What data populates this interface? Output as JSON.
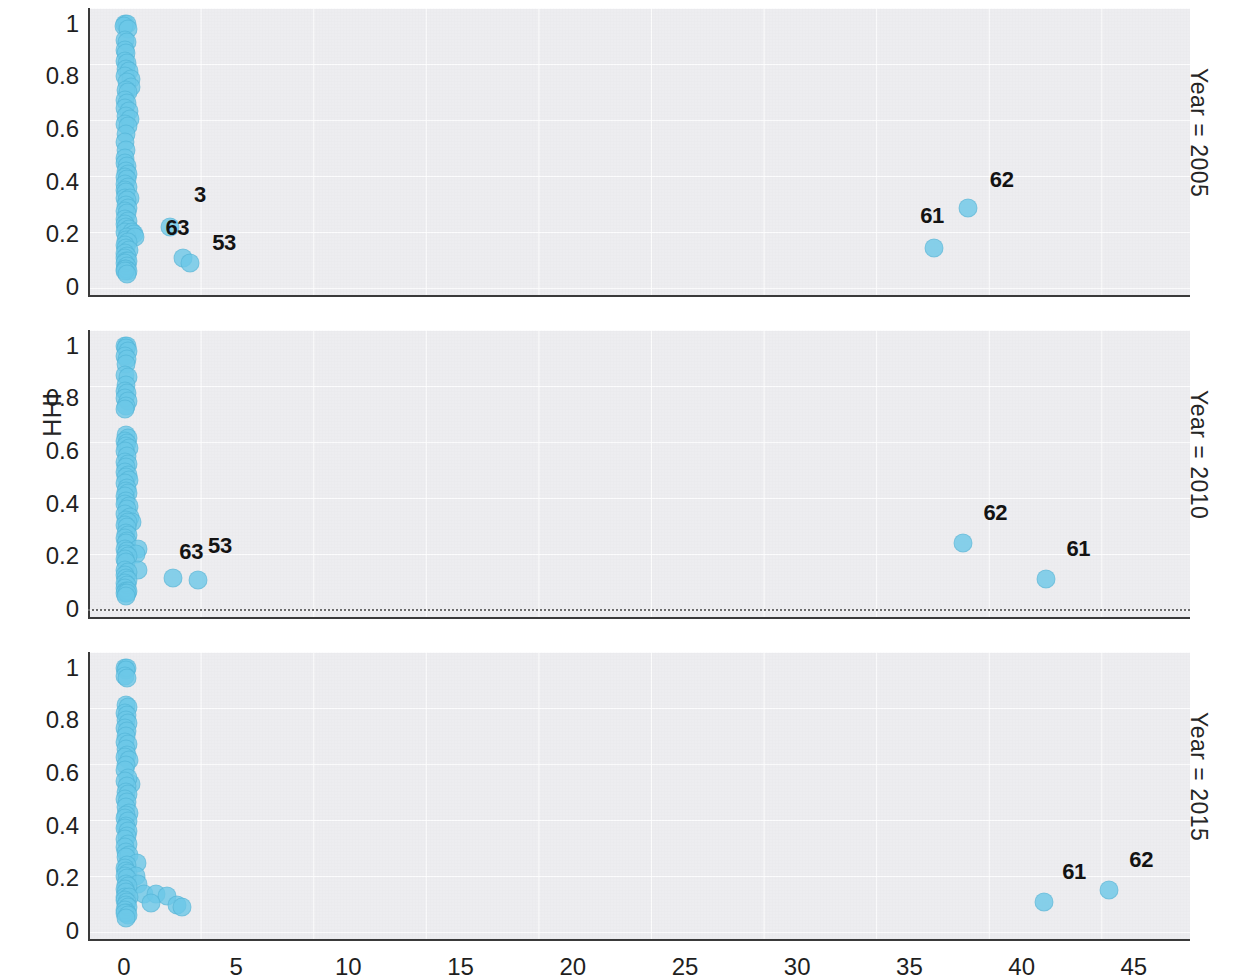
{
  "chart_data": {
    "type": "scatter",
    "title": "",
    "xlabel": "",
    "ylabel": "HHI",
    "xlim": [
      -1.6,
      47.5
    ],
    "ylim": [
      -0.03,
      1.06
    ],
    "xticks": [
      0,
      5,
      10,
      15,
      20,
      25,
      30,
      35,
      40,
      45
    ],
    "yticks": [
      "0",
      "0.2",
      "0.4",
      "0.6",
      "0.8",
      "1"
    ],
    "grid": true,
    "legend": "none",
    "marker_color": "#6CC8E8",
    "facet_variable": "Year",
    "panels": [
      {
        "facet_label": "Year = 2005",
        "zero_line": false,
        "points": [
          {
            "x": 0.05,
            "y": 1.0
          },
          {
            "x": 0.12,
            "y": 1.0
          },
          {
            "x": 0.02,
            "y": 0.99
          },
          {
            "x": 0.16,
            "y": 0.98
          },
          {
            "x": 0.07,
            "y": 0.94
          },
          {
            "x": 0.13,
            "y": 0.93
          },
          {
            "x": 0.04,
            "y": 0.9
          },
          {
            "x": 0.1,
            "y": 0.89
          },
          {
            "x": 0.06,
            "y": 0.86
          },
          {
            "x": 0.15,
            "y": 0.85
          },
          {
            "x": 0.09,
            "y": 0.83
          },
          {
            "x": 0.22,
            "y": 0.82
          },
          {
            "x": 0.05,
            "y": 0.8
          },
          {
            "x": 0.3,
            "y": 0.79
          },
          {
            "x": 0.12,
            "y": 0.78
          },
          {
            "x": 0.33,
            "y": 0.76
          },
          {
            "x": 0.08,
            "y": 0.75
          },
          {
            "x": 0.18,
            "y": 0.74
          },
          {
            "x": 0.06,
            "y": 0.71
          },
          {
            "x": 0.14,
            "y": 0.7
          },
          {
            "x": 0.04,
            "y": 0.68
          },
          {
            "x": 0.21,
            "y": 0.67
          },
          {
            "x": 0.1,
            "y": 0.65
          },
          {
            "x": 0.27,
            "y": 0.64
          },
          {
            "x": 0.06,
            "y": 0.62
          },
          {
            "x": 0.16,
            "y": 0.61
          },
          {
            "x": 0.08,
            "y": 0.58
          },
          {
            "x": 0.05,
            "y": 0.55
          },
          {
            "x": 0.11,
            "y": 0.52
          },
          {
            "x": 0.07,
            "y": 0.49
          },
          {
            "x": 0.03,
            "y": 0.47
          },
          {
            "x": 0.15,
            "y": 0.46
          },
          {
            "x": 0.09,
            "y": 0.44
          },
          {
            "x": 0.2,
            "y": 0.43
          },
          {
            "x": 0.05,
            "y": 0.42
          },
          {
            "x": 0.13,
            "y": 0.41
          },
          {
            "x": 0.07,
            "y": 0.39
          },
          {
            "x": 0.17,
            "y": 0.38
          },
          {
            "x": 0.04,
            "y": 0.37
          },
          {
            "x": 0.11,
            "y": 0.36
          },
          {
            "x": 0.06,
            "y": 0.34
          },
          {
            "x": 0.26,
            "y": 0.34
          },
          {
            "x": 0.14,
            "y": 0.33
          },
          {
            "x": 0.08,
            "y": 0.31
          },
          {
            "x": 0.19,
            "y": 0.3
          },
          {
            "x": 0.05,
            "y": 0.29
          },
          {
            "x": 0.12,
            "y": 0.28
          },
          {
            "x": 0.07,
            "y": 0.26
          },
          {
            "x": 0.16,
            "y": 0.25
          },
          {
            "x": 0.04,
            "y": 0.24
          },
          {
            "x": 0.1,
            "y": 0.23
          },
          {
            "x": 0.23,
            "y": 0.22
          },
          {
            "x": 0.06,
            "y": 0.21
          },
          {
            "x": 0.36,
            "y": 0.21
          },
          {
            "x": 0.44,
            "y": 0.2
          },
          {
            "x": 0.13,
            "y": 0.19
          },
          {
            "x": 0.08,
            "y": 0.18
          },
          {
            "x": 0.5,
            "y": 0.19
          },
          {
            "x": 0.18,
            "y": 0.17
          },
          {
            "x": 0.05,
            "y": 0.16
          },
          {
            "x": 0.11,
            "y": 0.15
          },
          {
            "x": 0.24,
            "y": 0.14
          },
          {
            "x": 0.07,
            "y": 0.13
          },
          {
            "x": 0.15,
            "y": 0.12
          },
          {
            "x": 0.04,
            "y": 0.11
          },
          {
            "x": 0.09,
            "y": 0.1
          },
          {
            "x": 0.2,
            "y": 0.1
          },
          {
            "x": 0.06,
            "y": 0.09
          },
          {
            "x": 0.13,
            "y": 0.08
          },
          {
            "x": 0.03,
            "y": 0.07
          },
          {
            "x": 0.1,
            "y": 0.07
          },
          {
            "x": 0.17,
            "y": 0.06
          },
          {
            "x": 0.05,
            "y": 0.06
          },
          {
            "x": 0.12,
            "y": 0.05
          }
        ],
        "labeled_points": [
          {
            "label": "3",
            "x": 2.05,
            "y": 0.23,
            "label_dx": 30,
            "label_dy": -32
          },
          {
            "label": "63",
            "x": 2.65,
            "y": 0.11,
            "label_dx": -6,
            "label_dy": -30
          },
          {
            "label": "53",
            "x": 2.95,
            "y": 0.09,
            "label_dx": 34,
            "label_dy": -20
          },
          {
            "label": "61",
            "x": 36.1,
            "y": 0.15,
            "label_dx": -2,
            "label_dy": -32
          },
          {
            "label": "62",
            "x": 37.6,
            "y": 0.3,
            "label_dx": 34,
            "label_dy": -28
          }
        ]
      },
      {
        "facet_label": "Year = 2010",
        "zero_line": true,
        "points": [
          {
            "x": 0.05,
            "y": 1.0
          },
          {
            "x": 0.13,
            "y": 1.0
          },
          {
            "x": 0.08,
            "y": 0.99
          },
          {
            "x": 0.18,
            "y": 0.98
          },
          {
            "x": 0.04,
            "y": 0.96
          },
          {
            "x": 0.15,
            "y": 0.95
          },
          {
            "x": 0.09,
            "y": 0.93
          },
          {
            "x": 0.06,
            "y": 0.89
          },
          {
            "x": 0.16,
            "y": 0.88
          },
          {
            "x": 0.1,
            "y": 0.85
          },
          {
            "x": 0.05,
            "y": 0.83
          },
          {
            "x": 0.14,
            "y": 0.82
          },
          {
            "x": 0.07,
            "y": 0.8
          },
          {
            "x": 0.17,
            "y": 0.79
          },
          {
            "x": 0.11,
            "y": 0.77
          },
          {
            "x": 0.06,
            "y": 0.76
          },
          {
            "x": 0.1,
            "y": 0.66
          },
          {
            "x": 0.2,
            "y": 0.65
          },
          {
            "x": 0.05,
            "y": 0.64
          },
          {
            "x": 0.15,
            "y": 0.63
          },
          {
            "x": 0.08,
            "y": 0.62
          },
          {
            "x": 0.23,
            "y": 0.61
          },
          {
            "x": 0.04,
            "y": 0.6
          },
          {
            "x": 0.12,
            "y": 0.58
          },
          {
            "x": 0.07,
            "y": 0.56
          },
          {
            "x": 0.19,
            "y": 0.55
          },
          {
            "x": 0.1,
            "y": 0.54
          },
          {
            "x": 0.05,
            "y": 0.52
          },
          {
            "x": 0.16,
            "y": 0.51
          },
          {
            "x": 0.09,
            "y": 0.5
          },
          {
            "x": 0.22,
            "y": 0.49
          },
          {
            "x": 0.06,
            "y": 0.48
          },
          {
            "x": 0.13,
            "y": 0.46
          },
          {
            "x": 0.08,
            "y": 0.45
          },
          {
            "x": 0.18,
            "y": 0.44
          },
          {
            "x": 0.04,
            "y": 0.43
          },
          {
            "x": 0.11,
            "y": 0.41
          },
          {
            "x": 0.07,
            "y": 0.4
          },
          {
            "x": 0.21,
            "y": 0.39
          },
          {
            "x": 0.14,
            "y": 0.38
          },
          {
            "x": 0.05,
            "y": 0.36
          },
          {
            "x": 0.26,
            "y": 0.35
          },
          {
            "x": 0.09,
            "y": 0.34
          },
          {
            "x": 0.38,
            "y": 0.33
          },
          {
            "x": 0.17,
            "y": 0.33
          },
          {
            "x": 0.06,
            "y": 0.32
          },
          {
            "x": 0.12,
            "y": 0.31
          },
          {
            "x": 0.08,
            "y": 0.29
          },
          {
            "x": 0.2,
            "y": 0.28
          },
          {
            "x": 0.04,
            "y": 0.27
          },
          {
            "x": 0.15,
            "y": 0.26
          },
          {
            "x": 0.1,
            "y": 0.25
          },
          {
            "x": 0.61,
            "y": 0.23
          },
          {
            "x": 0.06,
            "y": 0.23
          },
          {
            "x": 0.13,
            "y": 0.22
          },
          {
            "x": 0.55,
            "y": 0.21
          },
          {
            "x": 0.08,
            "y": 0.21
          },
          {
            "x": 0.18,
            "y": 0.2
          },
          {
            "x": 0.05,
            "y": 0.19
          },
          {
            "x": 0.11,
            "y": 0.18
          },
          {
            "x": 0.63,
            "y": 0.15
          },
          {
            "x": 0.07,
            "y": 0.15
          },
          {
            "x": 0.16,
            "y": 0.14
          },
          {
            "x": 0.04,
            "y": 0.13
          },
          {
            "x": 0.1,
            "y": 0.12
          },
          {
            "x": 0.2,
            "y": 0.11
          },
          {
            "x": 0.06,
            "y": 0.1
          },
          {
            "x": 0.14,
            "y": 0.09
          },
          {
            "x": 0.03,
            "y": 0.08
          },
          {
            "x": 0.09,
            "y": 0.07
          },
          {
            "x": 0.17,
            "y": 0.07
          },
          {
            "x": 0.05,
            "y": 0.06
          },
          {
            "x": 0.12,
            "y": 0.06
          },
          {
            "x": 0.08,
            "y": 0.05
          }
        ],
        "labeled_points": [
          {
            "label": "63",
            "x": 2.2,
            "y": 0.12,
            "label_dx": 18,
            "label_dy": -26
          },
          {
            "label": "53",
            "x": 3.3,
            "y": 0.11,
            "label_dx": 22,
            "label_dy": -34
          },
          {
            "label": "62",
            "x": 37.4,
            "y": 0.25,
            "label_dx": 32,
            "label_dy": -30
          },
          {
            "label": "61",
            "x": 41.1,
            "y": 0.115,
            "label_dx": 32,
            "label_dy": -30
          }
        ]
      },
      {
        "facet_label": "Year = 2015",
        "zero_line": false,
        "points": [
          {
            "x": 0.06,
            "y": 1.0
          },
          {
            "x": 0.14,
            "y": 1.0
          },
          {
            "x": 0.09,
            "y": 0.99
          },
          {
            "x": 0.04,
            "y": 0.97
          },
          {
            "x": 0.12,
            "y": 0.96
          },
          {
            "x": 0.08,
            "y": 0.86
          },
          {
            "x": 0.17,
            "y": 0.85
          },
          {
            "x": 0.05,
            "y": 0.83
          },
          {
            "x": 0.13,
            "y": 0.82
          },
          {
            "x": 0.09,
            "y": 0.8
          },
          {
            "x": 0.2,
            "y": 0.79
          },
          {
            "x": 0.06,
            "y": 0.77
          },
          {
            "x": 0.15,
            "y": 0.76
          },
          {
            "x": 0.1,
            "y": 0.74
          },
          {
            "x": 0.04,
            "y": 0.72
          },
          {
            "x": 0.18,
            "y": 0.71
          },
          {
            "x": 0.08,
            "y": 0.69
          },
          {
            "x": 0.13,
            "y": 0.67
          },
          {
            "x": 0.05,
            "y": 0.66
          },
          {
            "x": 0.22,
            "y": 0.65
          },
          {
            "x": 0.11,
            "y": 0.63
          },
          {
            "x": 0.07,
            "y": 0.61
          },
          {
            "x": 0.3,
            "y": 0.56
          },
          {
            "x": 0.16,
            "y": 0.58
          },
          {
            "x": 0.05,
            "y": 0.57
          },
          {
            "x": 0.12,
            "y": 0.55
          },
          {
            "x": 0.09,
            "y": 0.53
          },
          {
            "x": 0.19,
            "y": 0.52
          },
          {
            "x": 0.04,
            "y": 0.5
          },
          {
            "x": 0.14,
            "y": 0.49
          },
          {
            "x": 0.08,
            "y": 0.47
          },
          {
            "x": 0.24,
            "y": 0.45
          },
          {
            "x": 0.11,
            "y": 0.44
          },
          {
            "x": 0.06,
            "y": 0.43
          },
          {
            "x": 0.17,
            "y": 0.42
          },
          {
            "x": 0.09,
            "y": 0.4
          },
          {
            "x": 0.04,
            "y": 0.39
          },
          {
            "x": 0.2,
            "y": 0.38
          },
          {
            "x": 0.13,
            "y": 0.36
          },
          {
            "x": 0.07,
            "y": 0.35
          },
          {
            "x": 0.16,
            "y": 0.33
          },
          {
            "x": 0.05,
            "y": 0.32
          },
          {
            "x": 0.11,
            "y": 0.3
          },
          {
            "x": 0.23,
            "y": 0.29
          },
          {
            "x": 0.08,
            "y": 0.28
          },
          {
            "x": 0.6,
            "y": 0.26
          },
          {
            "x": 0.15,
            "y": 0.25
          },
          {
            "x": 0.04,
            "y": 0.24
          },
          {
            "x": 0.1,
            "y": 0.23
          },
          {
            "x": 0.19,
            "y": 0.22
          },
          {
            "x": 0.55,
            "y": 0.21
          },
          {
            "x": 0.06,
            "y": 0.21
          },
          {
            "x": 0.13,
            "y": 0.2
          },
          {
            "x": 0.62,
            "y": 0.18
          },
          {
            "x": 0.08,
            "y": 0.18
          },
          {
            "x": 0.17,
            "y": 0.17
          },
          {
            "x": 0.05,
            "y": 0.16
          },
          {
            "x": 0.11,
            "y": 0.15
          },
          {
            "x": 0.9,
            "y": 0.14
          },
          {
            "x": 1.45,
            "y": 0.14
          },
          {
            "x": 0.07,
            "y": 0.13
          },
          {
            "x": 0.21,
            "y": 0.13
          },
          {
            "x": 1.9,
            "y": 0.135
          },
          {
            "x": 0.04,
            "y": 0.12
          },
          {
            "x": 0.14,
            "y": 0.11
          },
          {
            "x": 1.2,
            "y": 0.105
          },
          {
            "x": 0.09,
            "y": 0.1
          },
          {
            "x": 2.35,
            "y": 0.1
          },
          {
            "x": 0.18,
            "y": 0.09
          },
          {
            "x": 0.06,
            "y": 0.08
          },
          {
            "x": 2.6,
            "y": 0.09
          },
          {
            "x": 0.12,
            "y": 0.07
          },
          {
            "x": 0.03,
            "y": 0.07
          },
          {
            "x": 0.16,
            "y": 0.06
          },
          {
            "x": 0.08,
            "y": 0.05
          }
        ],
        "labeled_points": [
          {
            "label": "61",
            "x": 41.0,
            "y": 0.11,
            "label_dx": 30,
            "label_dy": -30
          },
          {
            "label": "62",
            "x": 43.9,
            "y": 0.155,
            "label_dx": 32,
            "label_dy": -30
          }
        ]
      }
    ]
  }
}
